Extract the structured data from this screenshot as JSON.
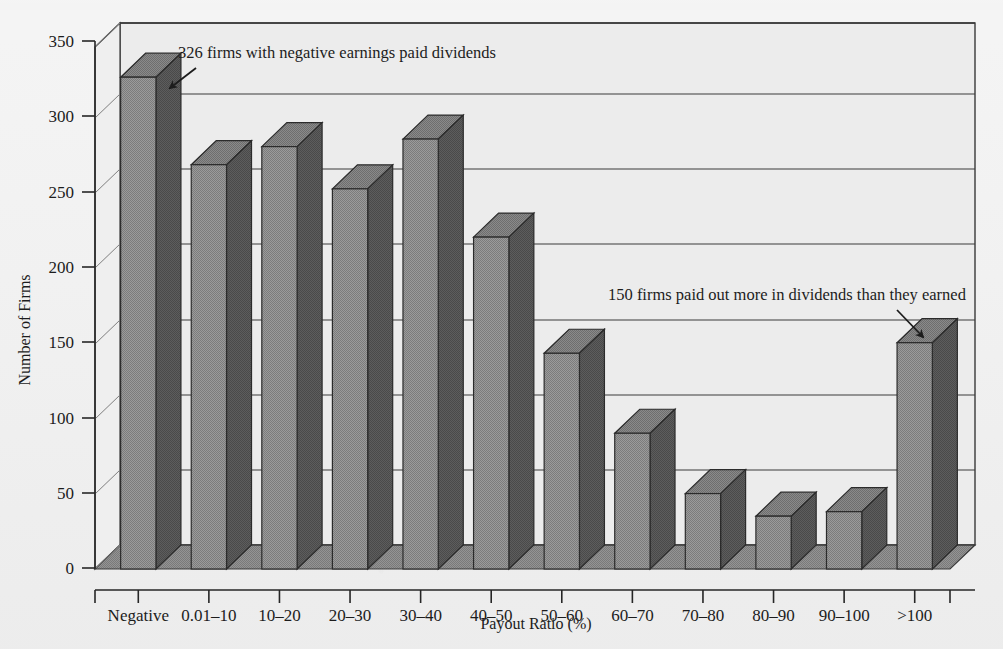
{
  "figure": {
    "background_color": "#f1f1f1",
    "plot_face_color": "#eeeeee",
    "floor_color": "#8d8d8d",
    "bar_front_color": "#909090",
    "bar_side_color": "#555555",
    "bar_top_color": "#7d7d7d",
    "line_color": "#3a3a3a"
  },
  "chart_data": {
    "type": "bar",
    "style": "3d-column",
    "title": "",
    "xlabel": "Payout Ratio (%)",
    "ylabel": "Number of Firms",
    "ylim": [
      0,
      350
    ],
    "yticks": [
      0,
      50,
      100,
      150,
      200,
      250,
      300,
      350
    ],
    "ytick_labels": [
      "0",
      "50",
      "100",
      "150",
      "200",
      "250",
      "300",
      "350"
    ],
    "grid": "horizontal",
    "legend": "none",
    "categories": [
      "Negative",
      "0.01–10",
      "10–20",
      "20–30",
      "30–40",
      "40–50",
      "50–60",
      "60–70",
      "70–80",
      "80–90",
      "90–100",
      ">100"
    ],
    "values": [
      326,
      268,
      280,
      252,
      285,
      220,
      143,
      90,
      50,
      35,
      38,
      150
    ],
    "annotations": [
      {
        "text": "326 firms with negative earnings paid dividends",
        "target_category": "Negative",
        "target_value": 326
      },
      {
        "text": "150 firms paid out more in dividends than they earned",
        "target_category": ">100",
        "target_value": 150
      }
    ]
  }
}
